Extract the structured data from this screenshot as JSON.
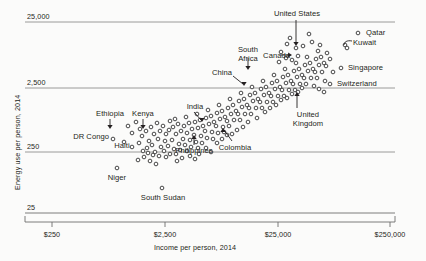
{
  "chart_data": {
    "type": "scatter",
    "title": "",
    "xlabel": "Income per person, 2014",
    "ylabel": "Energy use per person, 2014",
    "xscale": "log",
    "yscale": "log",
    "xlim": [
      250,
      250000
    ],
    "ylim": [
      25,
      25000
    ],
    "xticks": [
      "$250",
      "$2,500",
      "$25,000",
      "$250,000"
    ],
    "xtick_values": [
      250,
      2500,
      25000,
      250000
    ],
    "yticks": [
      "25",
      "250",
      "2,500",
      "25,000"
    ],
    "ytick_values": [
      25,
      250,
      2500,
      25000
    ],
    "grid": "horizontal",
    "legend": "none",
    "annotations": [
      {
        "label": "United States",
        "x": 52000,
        "y": 6800
      },
      {
        "label": "Qatar",
        "x": 125000,
        "y": 15000
      },
      {
        "label": "Kuwait",
        "x": 72000,
        "y": 9500
      },
      {
        "label": "Singapore",
        "x": 81000,
        "y": 5200
      },
      {
        "label": "Switzerland",
        "x": 59000,
        "y": 3000
      },
      {
        "label": "Canada",
        "x": 43000,
        "y": 7700
      },
      {
        "label": "United Kingdom",
        "x": 40000,
        "y": 2900
      },
      {
        "label": "South Africa",
        "x": 12500,
        "y": 2700
      },
      {
        "label": "China",
        "x": 12500,
        "y": 2200
      },
      {
        "label": "Colombia",
        "x": 13000,
        "y": 700
      },
      {
        "label": "India",
        "x": 5500,
        "y": 640
      },
      {
        "label": "Philippines",
        "x": 6800,
        "y": 470
      },
      {
        "label": "Kenya",
        "x": 2700,
        "y": 490
      },
      {
        "label": "Ethiopia",
        "x": 1400,
        "y": 480
      },
      {
        "label": "Haiti",
        "x": 1700,
        "y": 390
      },
      {
        "label": "DR Congo",
        "x": 750,
        "y": 390
      },
      {
        "label": "Niger",
        "x": 930,
        "y": 150
      },
      {
        "label": "South Sudan",
        "x": 2400,
        "y": 80
      }
    ],
    "points": [
      [
        113,
        139
      ],
      [
        117,
        168
      ],
      [
        162,
        188
      ],
      [
        132,
        133
      ],
      [
        140,
        129
      ],
      [
        142,
        136
      ],
      [
        146,
        131
      ],
      [
        151,
        127
      ],
      [
        154,
        134
      ],
      [
        149,
        141
      ],
      [
        139,
        143
      ],
      [
        157,
        123
      ],
      [
        160,
        131
      ],
      [
        163,
        126
      ],
      [
        166,
        134
      ],
      [
        158,
        139
      ],
      [
        152,
        145
      ],
      [
        147,
        148
      ],
      [
        143,
        151
      ],
      [
        155,
        152
      ],
      [
        161,
        147
      ],
      [
        165,
        141
      ],
      [
        169,
        130
      ],
      [
        170,
        121
      ],
      [
        173,
        127
      ],
      [
        176,
        134
      ],
      [
        172,
        140
      ],
      [
        168,
        146
      ],
      [
        164,
        151
      ],
      [
        159,
        156
      ],
      [
        153,
        155
      ],
      [
        148,
        153
      ],
      [
        175,
        119
      ],
      [
        178,
        124
      ],
      [
        181,
        131
      ],
      [
        184,
        126
      ],
      [
        187,
        133
      ],
      [
        183,
        139
      ],
      [
        179,
        144
      ],
      [
        174,
        149
      ],
      [
        170,
        154
      ],
      [
        166,
        157
      ],
      [
        186,
        117
      ],
      [
        189,
        123
      ],
      [
        192,
        129
      ],
      [
        195,
        122
      ],
      [
        198,
        128
      ],
      [
        194,
        135
      ],
      [
        190,
        140
      ],
      [
        185,
        145
      ],
      [
        180,
        150
      ],
      [
        176,
        154
      ],
      [
        197,
        114
      ],
      [
        200,
        120
      ],
      [
        203,
        126
      ],
      [
        206,
        118
      ],
      [
        209,
        124
      ],
      [
        205,
        131
      ],
      [
        201,
        136
      ],
      [
        196,
        142
      ],
      [
        191,
        147
      ],
      [
        187,
        151
      ],
      [
        208,
        110
      ],
      [
        211,
        116
      ],
      [
        214,
        122
      ],
      [
        217,
        113
      ],
      [
        220,
        119
      ],
      [
        216,
        126
      ],
      [
        212,
        132
      ],
      [
        207,
        138
      ],
      [
        202,
        143
      ],
      [
        198,
        148
      ],
      [
        219,
        105
      ],
      [
        222,
        111
      ],
      [
        225,
        117
      ],
      [
        228,
        108
      ],
      [
        231,
        114
      ],
      [
        227,
        121
      ],
      [
        223,
        127
      ],
      [
        218,
        133
      ],
      [
        213,
        139
      ],
      [
        230,
        99
      ],
      [
        233,
        105
      ],
      [
        236,
        111
      ],
      [
        239,
        101
      ],
      [
        242,
        107
      ],
      [
        238,
        114
      ],
      [
        234,
        120
      ],
      [
        229,
        126
      ],
      [
        224,
        132
      ],
      [
        241,
        93
      ],
      [
        244,
        99
      ],
      [
        247,
        105
      ],
      [
        250,
        95
      ],
      [
        253,
        101
      ],
      [
        249,
        108
      ],
      [
        245,
        114
      ],
      [
        240,
        120
      ],
      [
        252,
        87
      ],
      [
        255,
        93
      ],
      [
        258,
        99
      ],
      [
        261,
        89
      ],
      [
        264,
        95
      ],
      [
        260,
        102
      ],
      [
        256,
        108
      ],
      [
        251,
        114
      ],
      [
        263,
        81
      ],
      [
        266,
        87
      ],
      [
        269,
        93
      ],
      [
        272,
        83
      ],
      [
        275,
        89
      ],
      [
        271,
        96
      ],
      [
        267,
        102
      ],
      [
        262,
        108
      ],
      [
        274,
        75
      ],
      [
        277,
        81
      ],
      [
        280,
        87
      ],
      [
        283,
        77
      ],
      [
        286,
        83
      ],
      [
        282,
        90
      ],
      [
        278,
        96
      ],
      [
        273,
        102
      ],
      [
        285,
        69
      ],
      [
        288,
        75
      ],
      [
        291,
        81
      ],
      [
        294,
        71
      ],
      [
        297,
        77
      ],
      [
        293,
        84
      ],
      [
        289,
        90
      ],
      [
        284,
        96
      ],
      [
        296,
        63
      ],
      [
        299,
        69
      ],
      [
        302,
        75
      ],
      [
        305,
        65
      ],
      [
        308,
        71
      ],
      [
        304,
        78
      ],
      [
        300,
        84
      ],
      [
        295,
        90
      ],
      [
        307,
        57
      ],
      [
        310,
        63
      ],
      [
        313,
        69
      ],
      [
        316,
        59
      ],
      [
        319,
        65
      ],
      [
        315,
        72
      ],
      [
        311,
        78
      ],
      [
        306,
        84
      ],
      [
        318,
        51
      ],
      [
        321,
        57
      ],
      [
        324,
        63
      ],
      [
        327,
        53
      ],
      [
        330,
        59
      ],
      [
        326,
        66
      ],
      [
        322,
        72
      ],
      [
        317,
        78
      ],
      [
        303,
        46
      ],
      [
        312,
        42
      ],
      [
        290,
        38
      ],
      [
        296,
        48
      ],
      [
        281,
        52
      ],
      [
        287,
        44
      ],
      [
        320,
        45
      ],
      [
        345,
        45
      ],
      [
        347,
        48
      ],
      [
        358,
        33
      ],
      [
        341,
        68
      ],
      [
        330,
        84
      ],
      [
        309,
        34
      ],
      [
        298,
        56
      ],
      [
        292,
        60
      ],
      [
        286,
        58
      ],
      [
        279,
        62
      ],
      [
        325,
        81
      ],
      [
        333,
        72
      ],
      [
        128,
        126
      ],
      [
        136,
        122
      ],
      [
        124,
        142
      ],
      [
        132,
        147
      ],
      [
        144,
        157
      ],
      [
        138,
        160
      ],
      [
        150,
        161
      ],
      [
        156,
        164
      ],
      [
        190,
        156
      ],
      [
        195,
        159
      ],
      [
        182,
        158
      ],
      [
        177,
        161
      ],
      [
        206,
        148
      ],
      [
        211,
        152
      ],
      [
        199,
        154
      ],
      [
        217,
        143
      ],
      [
        222,
        139
      ],
      [
        227,
        135
      ],
      [
        257,
        118
      ],
      [
        248,
        122
      ],
      [
        243,
        127
      ],
      [
        237,
        130
      ],
      [
        232,
        134
      ],
      [
        265,
        112
      ],
      [
        270,
        108
      ],
      [
        276,
        105
      ],
      [
        281,
        100
      ],
      [
        287,
        98
      ],
      [
        292,
        94
      ],
      [
        298,
        92
      ],
      [
        302,
        88
      ],
      [
        314,
        86
      ],
      [
        319,
        89
      ],
      [
        324,
        92
      ]
    ]
  }
}
